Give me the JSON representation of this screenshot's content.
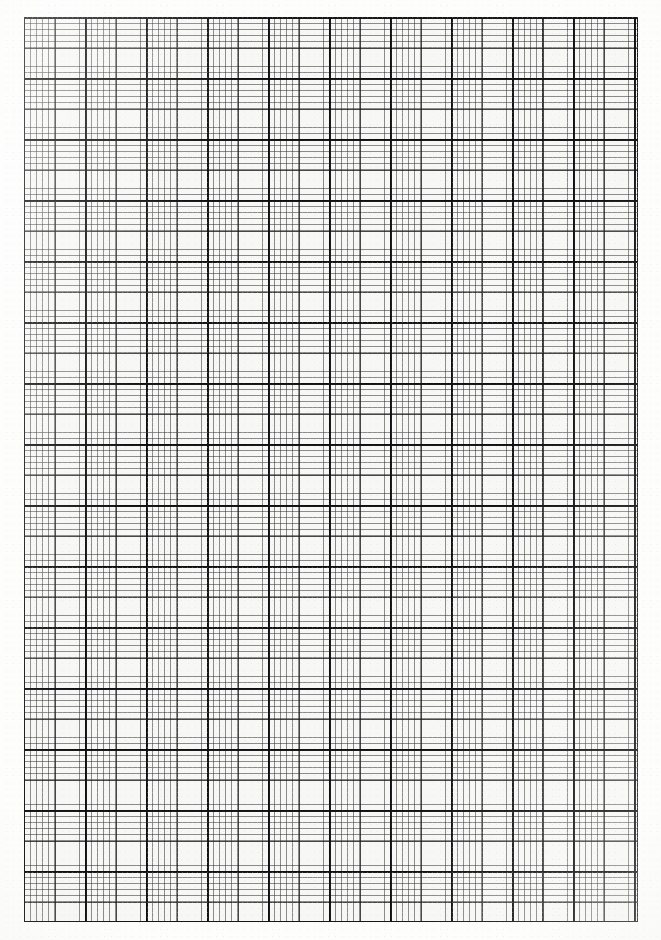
{
  "document": {
    "kind": "graph-paper-sheet",
    "title": "Graph paper sheet",
    "description": "Scanned blank sheet of millimetre / engineering graph paper with a three-level ruling hierarchy.",
    "page_width_px": 661,
    "page_height_px": 940,
    "background_color": "#fbfbfa",
    "paper_color": "#f7f7f5"
  },
  "grid": {
    "origin_x_px": 24,
    "origin_y_px": 17,
    "width_px": 614,
    "height_px": 905,
    "border": {
      "label": "outer rule",
      "color": "#15151a",
      "thickness_px": 1.8
    },
    "levels": [
      {
        "name": "fine",
        "label": "fine rule",
        "spacing_px": 6.1,
        "thickness_px": 0.7,
        "color": "#28282c",
        "opacity": 0.52,
        "columns": 100,
        "rows": 148
      },
      {
        "name": "medium",
        "label": "medium rule",
        "spacing_px": 30.5,
        "thickness_px": 1.0,
        "color": "#1a1a1e",
        "opacity": 0.8,
        "columns": 20,
        "rows": 29
      },
      {
        "name": "major",
        "label": "major rule",
        "spacing_px": 61,
        "thickness_px": 1.5,
        "color": "#0e0e12",
        "opacity": 0.95,
        "columns": 10,
        "rows": 14
      }
    ]
  },
  "margins": {
    "left_px": 24,
    "right_px": 23,
    "top_px": 17,
    "bottom_px": 18,
    "color": "#fdfdfc"
  },
  "chart_data": {
    "type": "table",
    "xlabel": "",
    "ylabel": "",
    "columns": [
      "Ruling level",
      "Spacing (px)",
      "Line width (px)",
      "Divisions across",
      "Divisions down"
    ],
    "rows": [
      [
        "Fine",
        "6.1",
        "0.7",
        "100",
        "148"
      ],
      [
        "Medium",
        "30.5",
        "1.0",
        "20",
        "29"
      ],
      [
        "Major",
        "61.0",
        "1.5",
        "10",
        "14"
      ],
      [
        "Border",
        "—",
        "1.8",
        "1",
        "1"
      ]
    ],
    "grid": true,
    "legend": "none"
  }
}
